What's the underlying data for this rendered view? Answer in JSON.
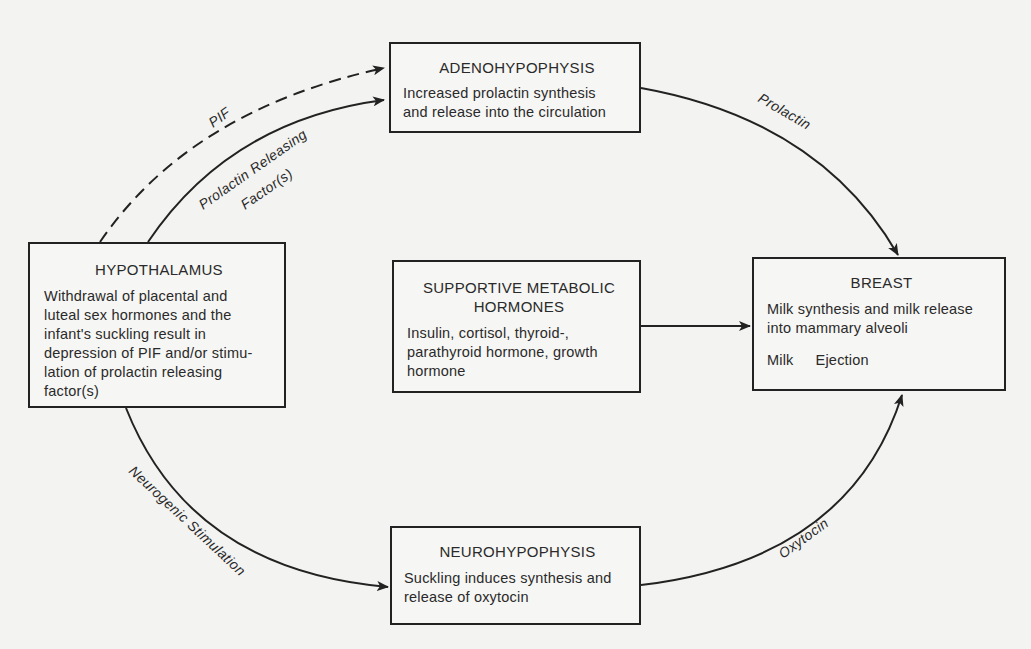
{
  "nodes": {
    "hypothalamus": {
      "title": "HYPOTHALAMUS",
      "lines": [
        "Withdrawal of placental and",
        "luteal sex hormones and the",
        "infant's suckling result in",
        "depression of PIF and/or stimu-",
        "lation of prolactin releasing",
        "factor(s)"
      ]
    },
    "adenohypophysis": {
      "title": "ADENOHYPOPHYSIS",
      "lines": [
        "Increased prolactin synthesis",
        "and release into the circulation"
      ]
    },
    "supportive": {
      "title_lines": [
        "SUPPORTIVE METABOLIC",
        "HORMONES"
      ],
      "lines": [
        "Insulin, cortisol, thyroid-,",
        "parathyroid hormone, growth",
        "hormone"
      ]
    },
    "breast": {
      "title": "BREAST",
      "lines": [
        "Milk synthesis and milk release",
        "into mammary alveoli"
      ],
      "ejection": [
        "Milk",
        "Ejection"
      ]
    },
    "neurohypophysis": {
      "title": "NEUROHYPOPHYSIS",
      "lines": [
        "Suckling induces synthesis and",
        "release of oxytocin"
      ]
    }
  },
  "edges": {
    "pif": {
      "label": "PIF",
      "style": "dashed",
      "from": "HYPOTHALAMUS",
      "to": "ADENOHYPOPHYSIS"
    },
    "prf": {
      "label_lines": [
        "Prolactin Releasing",
        "Factor(s)"
      ],
      "style": "solid",
      "from": "HYPOTHALAMUS",
      "to": "ADENOHYPOPHYSIS"
    },
    "prolactin": {
      "label": "Prolactin",
      "style": "solid",
      "from": "ADENOHYPOPHYSIS",
      "to": "BREAST"
    },
    "supportive": {
      "label": "",
      "style": "solid",
      "from": "SUPPORTIVE METABOLIC HORMONES",
      "to": "BREAST"
    },
    "neurogenic": {
      "label": "Neurogenic Stimulation",
      "style": "solid",
      "from": "HYPOTHALAMUS",
      "to": "NEUROHYPOPHYSIS"
    },
    "oxytocin": {
      "label": "Oxytocin",
      "style": "solid",
      "from": "NEUROHYPOPHYSIS",
      "to": "BREAST"
    }
  },
  "colors": {
    "background": "#f3f3f1",
    "ink": "#222222"
  }
}
